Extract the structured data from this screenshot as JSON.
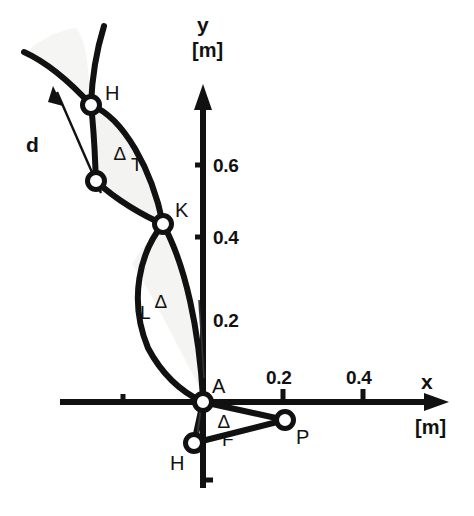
{
  "figure": {
    "axes": {
      "x": {
        "name": "x",
        "unit": "[m]",
        "ticks": [
          {
            "value": "0.2",
            "px": 283
          },
          {
            "value": "0.4",
            "px": 363
          }
        ],
        "negative_tick_px": 123,
        "axis_y_px": 402,
        "arrow_end_px": 444
      },
      "y": {
        "name": "y",
        "unit": "[m]",
        "ticks": [
          {
            "value": "0.6",
            "px": 165
          },
          {
            "value": "0.4",
            "px": 237
          },
          {
            "value": "0.2",
            "px": 320
          }
        ],
        "negative_tick_px": 480,
        "axis_x_px": 203,
        "arrow_end_px": 84
      },
      "origin": {
        "x": 203,
        "y": 402
      },
      "scale_px_per_m": 400
    },
    "points": [
      {
        "name": "H",
        "label": "H",
        "x": 91,
        "y": 105,
        "label_dx": 14,
        "label_dy": -22,
        "marker": true
      },
      {
        "name": "mid-thigh-joint",
        "label": "",
        "x": 96,
        "y": 181,
        "label_dx": 0,
        "label_dy": 0,
        "marker": true
      },
      {
        "name": "K",
        "label": "K",
        "x": 163,
        "y": 224,
        "label_dx": 12,
        "label_dy": -24,
        "marker": true
      },
      {
        "name": "A",
        "label": "A",
        "x": 203,
        "y": 402,
        "label_dx": 9,
        "label_dy": -26,
        "marker": true
      },
      {
        "name": "H-lower",
        "label": "H",
        "x": 194,
        "y": 443,
        "label_dx": -24,
        "label_dy": 10,
        "marker": true
      },
      {
        "name": "P",
        "label": "P",
        "x": 285,
        "y": 420,
        "label_dx": 11,
        "label_dy": 7,
        "marker": true
      }
    ],
    "segments": [
      {
        "name": "delta-T",
        "base": "T",
        "delta": "∆",
        "x": 120,
        "y": 155
      },
      {
        "name": "delta-L",
        "base": "L",
        "delta": "∆",
        "x": 140,
        "y": 305
      },
      {
        "name": "delta-F",
        "base": "F",
        "delta": "∆",
        "delta_x": 222,
        "delta_y": 418,
        "x": 222,
        "y": 434
      }
    ],
    "vectors": [
      {
        "name": "d",
        "label": "d",
        "x": 28,
        "y": 138,
        "from_x": 101,
        "from_y": 193,
        "to_x": 53,
        "to_y": 88
      }
    ],
    "colors": {
      "stroke": "#111111",
      "fill_shaded": "#f4f4f2",
      "background": "#ffffff",
      "marker_fill": "#ffffff"
    }
  }
}
